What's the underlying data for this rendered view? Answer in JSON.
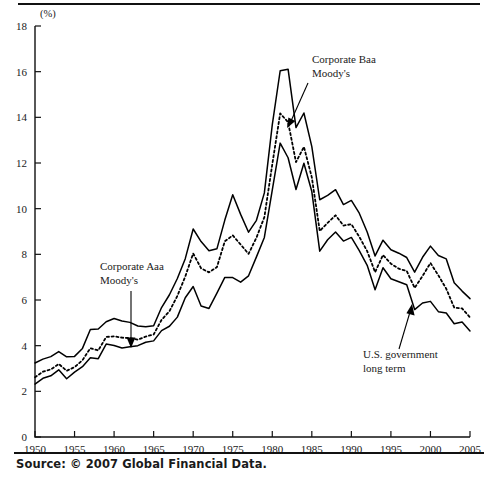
{
  "figure": {
    "y_axis_unit_label": "(%)",
    "source_note": "Source: © 2007 Global Financial Data."
  },
  "annotations": {
    "baa": {
      "line1": "Corporate Baa",
      "line2": "Moody's"
    },
    "aaa": {
      "line1": "Corporate Aaa",
      "line2": "Moody's"
    },
    "gov": {
      "line1": "U.S. government",
      "line2": "long term"
    }
  },
  "chart_data": {
    "type": "line",
    "title": "",
    "xlabel": "",
    "ylabel": "(%)",
    "xlim": [
      1950,
      2005
    ],
    "ylim": [
      0,
      18
    ],
    "grid": false,
    "legend": "annotated-inline",
    "xticks": [
      1950,
      1955,
      1960,
      1965,
      1970,
      1975,
      1980,
      1985,
      1990,
      1995,
      2000,
      2005
    ],
    "yticks": [
      0,
      2,
      4,
      6,
      8,
      10,
      12,
      14,
      16,
      18
    ],
    "x": [
      1950,
      1951,
      1952,
      1953,
      1954,
      1955,
      1956,
      1957,
      1958,
      1959,
      1960,
      1961,
      1962,
      1963,
      1964,
      1965,
      1966,
      1967,
      1968,
      1969,
      1970,
      1971,
      1972,
      1973,
      1974,
      1975,
      1976,
      1977,
      1978,
      1979,
      1980,
      1981,
      1982,
      1983,
      1984,
      1985,
      1986,
      1987,
      1988,
      1989,
      1990,
      1991,
      1992,
      1993,
      1994,
      1995,
      1996,
      1997,
      1998,
      1999,
      2000,
      2001,
      2002,
      2003,
      2004,
      2005
    ],
    "series": [
      {
        "name": "Corporate Baa Moody's",
        "style": "solid",
        "values": [
          3.24,
          3.41,
          3.52,
          3.74,
          3.51,
          3.53,
          3.88,
          4.71,
          4.73,
          5.05,
          5.19,
          5.08,
          5.02,
          4.86,
          4.83,
          4.87,
          5.67,
          6.23,
          6.94,
          7.81,
          9.11,
          8.56,
          8.16,
          8.24,
          9.5,
          10.61,
          9.75,
          8.97,
          9.49,
          10.69,
          13.67,
          16.04,
          16.11,
          13.55,
          14.19,
          12.72,
          10.39,
          10.58,
          10.83,
          10.18,
          10.36,
          9.8,
          8.98,
          7.93,
          8.62,
          8.2,
          8.05,
          7.86,
          7.22,
          7.87,
          8.36,
          7.95,
          7.8,
          6.76,
          6.39,
          6.06
        ]
      },
      {
        "name": "Corporate Aaa Moody's",
        "style": "dotted",
        "values": [
          2.62,
          2.86,
          2.96,
          3.2,
          2.9,
          3.06,
          3.36,
          3.89,
          3.79,
          4.38,
          4.41,
          4.35,
          4.33,
          4.26,
          4.4,
          4.49,
          5.13,
          5.51,
          6.18,
          7.03,
          8.04,
          7.39,
          7.21,
          7.44,
          8.57,
          8.83,
          8.43,
          8.02,
          8.73,
          9.63,
          11.94,
          14.17,
          13.79,
          12.04,
          12.71,
          11.37,
          9.02,
          9.38,
          9.71,
          9.26,
          9.32,
          8.77,
          8.14,
          7.22,
          7.97,
          7.59,
          7.37,
          7.27,
          6.53,
          7.05,
          7.62,
          7.08,
          6.49,
          5.67,
          5.63,
          5.24
        ]
      },
      {
        "name": "U.S. government long term",
        "style": "solid",
        "values": [
          2.32,
          2.57,
          2.68,
          2.94,
          2.55,
          2.84,
          3.08,
          3.47,
          3.43,
          4.07,
          4.01,
          3.9,
          3.95,
          4.0,
          4.15,
          4.21,
          4.66,
          4.85,
          5.25,
          6.1,
          6.59,
          5.74,
          5.63,
          6.3,
          6.99,
          6.98,
          6.78,
          7.06,
          7.89,
          8.74,
          10.81,
          12.87,
          12.23,
          10.84,
          11.99,
          10.75,
          8.14,
          8.64,
          8.98,
          8.58,
          8.74,
          8.16,
          7.52,
          6.45,
          7.41,
          6.93,
          6.8,
          6.67,
          5.58,
          5.87,
          5.94,
          5.49,
          5.43,
          4.96,
          5.04,
          4.64
        ]
      }
    ]
  }
}
